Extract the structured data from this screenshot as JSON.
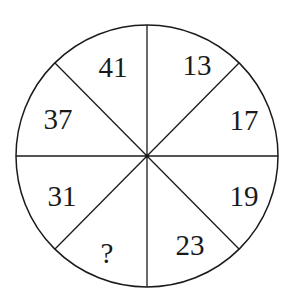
{
  "diagram": {
    "type": "number-wheel-puzzle",
    "sectors": [
      {
        "position": "top-left-upper",
        "value": "41"
      },
      {
        "position": "top-right-upper",
        "value": "13"
      },
      {
        "position": "right-upper",
        "value": "17"
      },
      {
        "position": "right-lower",
        "value": "19"
      },
      {
        "position": "bottom-right",
        "value": "23"
      },
      {
        "position": "bottom-left",
        "value": "?"
      },
      {
        "position": "left-lower",
        "value": "31"
      },
      {
        "position": "left-upper",
        "value": "37"
      }
    ],
    "colors": {
      "stroke": "#1a1a1a",
      "background": "#ffffff"
    }
  }
}
